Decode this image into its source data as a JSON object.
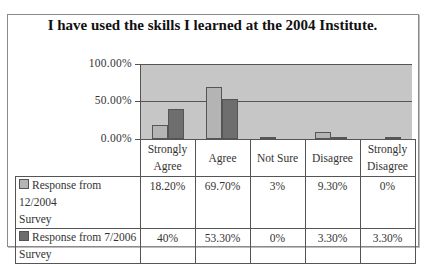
{
  "chart_data": {
    "type": "bar",
    "title": "I have used the skills I learned at the 2004 Institute.",
    "categories": [
      "Strongly Agree",
      "Agree",
      "Not Sure",
      "Disagree",
      "Strongly Disagree"
    ],
    "series": [
      {
        "name": "Response from 12/2004 Survey",
        "values": [
          18.2,
          69.7,
          3,
          9.3,
          0
        ],
        "labels": [
          "18.20%",
          "69.70%",
          "3%",
          "9.30%",
          "0%"
        ],
        "color": "#b4b4b4"
      },
      {
        "name": "Response from 7/2006 Survey",
        "values": [
          40,
          53.3,
          0,
          3.3,
          3.3
        ],
        "labels": [
          "40%",
          "53.30%",
          "0%",
          "3.30%",
          "3.30%"
        ],
        "color": "#6e6e6e"
      }
    ],
    "yticks": [
      "100.00%",
      "50.00%",
      "0.00%"
    ],
    "ylim": [
      0,
      100
    ],
    "xlabel": "",
    "ylabel": "",
    "grid": true,
    "legend_position": "data-table",
    "plot_background": "#c6c6c6"
  },
  "header": {
    "cat0_line1": "Strongly",
    "cat0_line2": "Agree",
    "cat1": "Agree",
    "cat2": "Not Sure",
    "cat3": "Disagree",
    "cat4_line1": "Strongly",
    "cat4_line2": "Disagree"
  },
  "rows": [
    {
      "label_line1": "Response from 12/2004",
      "label_line2": "Survey"
    },
    {
      "label_line1": "Response from 7/2006",
      "label_line2": "Survey"
    }
  ]
}
